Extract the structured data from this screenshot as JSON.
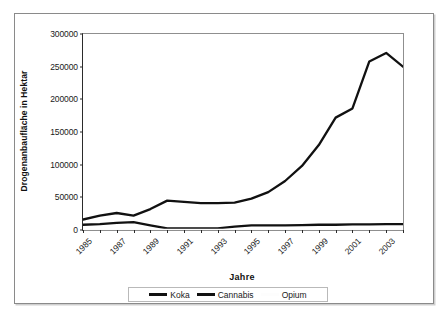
{
  "chart_data": {
    "type": "line",
    "title": "",
    "xlabel": "Jahre",
    "ylabel": "Drogenanbaufläche in Hektar",
    "x": [
      1985,
      1986,
      1987,
      1988,
      1989,
      1990,
      1991,
      1992,
      1993,
      1994,
      1995,
      1996,
      1997,
      1998,
      1999,
      2000,
      2001,
      2002,
      2003,
      2004
    ],
    "xticklabels": [
      "1985",
      "1987",
      "1989",
      "1991",
      "1993",
      "1995",
      "1997",
      "1999",
      "2001",
      "2003"
    ],
    "xtickvalues": [
      1985,
      1987,
      1989,
      1991,
      1993,
      1995,
      1997,
      1999,
      2001,
      2003
    ],
    "xlim": [
      1985,
      2004
    ],
    "ylim": [
      0,
      300000
    ],
    "yticklabels": [
      "0",
      "50000",
      "100000",
      "150000",
      "200000",
      "250000",
      "300000"
    ],
    "ytickvalues": [
      0,
      50000,
      100000,
      150000,
      200000,
      250000,
      300000
    ],
    "grid": false,
    "legend_position": "bottom",
    "series": [
      {
        "name": "Koka",
        "color": "#111111",
        "values": [
          16000,
          22000,
          26000,
          22000,
          32000,
          45000,
          43000,
          41000,
          41000,
          42000,
          48000,
          58000,
          75000,
          98000,
          130000,
          172000,
          186000,
          258000,
          271000,
          250000
        ]
      },
      {
        "name": "Cannabis",
        "color": "#111111",
        "values": [
          8000,
          9000,
          11000,
          12000,
          7000,
          2500,
          2500,
          2500,
          2500,
          5000,
          7000,
          7000,
          7000,
          7500,
          8000,
          8000,
          8500,
          8500,
          9000,
          9000
        ]
      },
      {
        "name": "Opium",
        "color": "#fdfdfd",
        "values": [
          0,
          0,
          0,
          0,
          0,
          0,
          0,
          0,
          0,
          0,
          0,
          0,
          0,
          0,
          0,
          0,
          0,
          0,
          0,
          0
        ]
      }
    ]
  },
  "legend": {
    "items": [
      {
        "label": "Koka",
        "swatch": "line-swatch-koka"
      },
      {
        "label": "Cannabis",
        "swatch": "line-swatch-cannabis"
      },
      {
        "label": "Opium",
        "swatch": "line-swatch-opium"
      }
    ]
  }
}
